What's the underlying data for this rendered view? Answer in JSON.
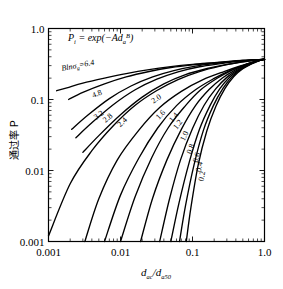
{
  "chart_data": {
    "type": "line",
    "title": "",
    "formula": "P",
    "formula_sub": "i",
    "formula_rest": " = exp(−Ad",
    "formula_sub2": "a",
    "formula_sup2": "B",
    "formula_end": ")",
    "formula_plain": "P_i = exp(-A d_a^B)",
    "xlabel_num": "d",
    "xlabel_num_sub": "ac",
    "xlabel_den": "d",
    "xlabel_den_sub": "a50",
    "xlabel_plain": "d_ac/d_a50",
    "ylabel": "通过率 P",
    "xscale": "log",
    "yscale": "log",
    "xlim": [
      0.001,
      1.0
    ],
    "ylim": [
      0.001,
      1.0
    ],
    "xticklabels": [
      "0.001",
      "0.01",
      "0.1",
      "1.0"
    ],
    "xtickvalues": [
      0.001,
      0.01,
      0.1,
      1.0
    ],
    "yticklabels": [
      "0.001",
      "0.01",
      "0.1",
      "1.0"
    ],
    "ytickvalues": [
      0.001,
      0.01,
      0.1,
      1.0
    ],
    "grid": false,
    "legend_position": "inline-curve-labels",
    "param_name": "Blnσ_g",
    "param_label_prefix": "B",
    "param_label_ln": "ln",
    "param_label_sigma": "σ",
    "param_label_sub": "g",
    "param_label_eq": "=6.4",
    "convergence_point": {
      "x": 1.0,
      "y": 0.368
    },
    "note": "Each curve: P = exp(-0.693 * x^(-B)) family; curves all pass through (1.0, 0.368)",
    "series": [
      {
        "name": "6.4",
        "B": 6.4,
        "label": "Blnσ_g=6.4",
        "x": [
          0.0013,
          0.0018,
          0.003,
          0.006,
          0.012,
          0.025,
          0.05,
          0.1,
          0.2,
          0.35,
          0.55,
          0.75,
          1.0
        ],
        "y": [
          0.133,
          0.146,
          0.17,
          0.2,
          0.232,
          0.264,
          0.29,
          0.312,
          0.33,
          0.346,
          0.356,
          0.363,
          0.368
        ]
      },
      {
        "name": "4.8",
        "B": 4.8,
        "label": "4.8",
        "x": [
          0.0019,
          0.003,
          0.006,
          0.012,
          0.025,
          0.05,
          0.1,
          0.2,
          0.35,
          0.55,
          0.75,
          1.0
        ],
        "y": [
          0.1,
          0.126,
          0.166,
          0.208,
          0.248,
          0.282,
          0.308,
          0.328,
          0.345,
          0.356,
          0.363,
          0.368
        ]
      },
      {
        "name": "3.2",
        "B": 3.2,
        "label": "3.2",
        "x": [
          0.0021,
          0.0035,
          0.007,
          0.014,
          0.028,
          0.055,
          0.11,
          0.22,
          0.38,
          0.58,
          0.78,
          1.0
        ],
        "y": [
          0.038,
          0.06,
          0.103,
          0.155,
          0.208,
          0.255,
          0.295,
          0.324,
          0.344,
          0.357,
          0.364,
          0.368
        ]
      },
      {
        "name": "2.8",
        "B": 2.8,
        "label": "2.8",
        "x": [
          0.0024,
          0.004,
          0.008,
          0.016,
          0.032,
          0.063,
          0.125,
          0.25,
          0.4,
          0.6,
          0.8,
          1.0
        ],
        "y": [
          0.029,
          0.047,
          0.085,
          0.137,
          0.193,
          0.245,
          0.289,
          0.32,
          0.341,
          0.355,
          0.363,
          0.368
        ]
      },
      {
        "name": "2.4",
        "B": 2.4,
        "label": "2.4",
        "x": [
          0.003,
          0.005,
          0.01,
          0.02,
          0.04,
          0.08,
          0.16,
          0.3,
          0.48,
          0.68,
          0.85,
          1.0
        ],
        "y": [
          0.018,
          0.031,
          0.061,
          0.108,
          0.166,
          0.224,
          0.273,
          0.312,
          0.337,
          0.353,
          0.362,
          0.368
        ]
      },
      {
        "name": "2.0",
        "B": 2.0,
        "label": "2.0",
        "x": [
          0.001,
          0.002,
          0.004,
          0.008,
          0.016,
          0.032,
          0.063,
          0.125,
          0.25,
          0.42,
          0.62,
          0.82,
          1.0
        ],
        "y": [
          0.0012,
          0.0065,
          0.019,
          0.043,
          0.083,
          0.134,
          0.191,
          0.247,
          0.297,
          0.33,
          0.35,
          0.362,
          0.368
        ]
      },
      {
        "name": "1.6",
        "B": 1.6,
        "label": "1.6",
        "x": [
          0.0032,
          0.005,
          0.009,
          0.018,
          0.035,
          0.07,
          0.14,
          0.28,
          0.45,
          0.65,
          0.84,
          1.0
        ],
        "y": [
          0.001,
          0.004,
          0.014,
          0.037,
          0.077,
          0.13,
          0.19,
          0.249,
          0.294,
          0.33,
          0.355,
          0.368
        ]
      },
      {
        "name": "1.4",
        "B": 1.4,
        "label": "1.4",
        "x": [
          0.006,
          0.01,
          0.018,
          0.033,
          0.06,
          0.11,
          0.2,
          0.33,
          0.5,
          0.7,
          0.86,
          1.0
        ],
        "y": [
          0.001,
          0.0045,
          0.015,
          0.04,
          0.082,
          0.137,
          0.198,
          0.255,
          0.301,
          0.336,
          0.357,
          0.368
        ]
      },
      {
        "name": "1.2",
        "B": 1.2,
        "label": "1.2",
        "x": [
          0.01,
          0.016,
          0.027,
          0.046,
          0.08,
          0.13,
          0.22,
          0.35,
          0.52,
          0.72,
          0.87,
          1.0
        ],
        "y": [
          0.001,
          0.0043,
          0.015,
          0.04,
          0.082,
          0.137,
          0.199,
          0.257,
          0.303,
          0.339,
          0.358,
          0.368
        ]
      },
      {
        "name": "1.0",
        "B": 1.0,
        "label": "1.0",
        "x": [
          0.019,
          0.028,
          0.044,
          0.07,
          0.11,
          0.17,
          0.26,
          0.39,
          0.56,
          0.74,
          0.88,
          1.0
        ],
        "y": [
          0.001,
          0.0041,
          0.014,
          0.038,
          0.082,
          0.138,
          0.201,
          0.26,
          0.307,
          0.341,
          0.359,
          0.368
        ]
      },
      {
        "name": "0.8",
        "B": 0.8,
        "label": "0.8",
        "x": [
          0.035,
          0.048,
          0.068,
          0.1,
          0.145,
          0.21,
          0.3,
          0.43,
          0.59,
          0.76,
          0.89,
          1.0
        ],
        "y": [
          0.001,
          0.004,
          0.014,
          0.039,
          0.083,
          0.141,
          0.205,
          0.264,
          0.31,
          0.343,
          0.36,
          0.368
        ]
      },
      {
        "name": "0.6",
        "B": 0.6,
        "label": "0.6",
        "x": [
          0.05,
          0.065,
          0.09,
          0.125,
          0.175,
          0.24,
          0.33,
          0.46,
          0.62,
          0.78,
          0.9,
          1.0
        ],
        "y": [
          0.001,
          0.0035,
          0.013,
          0.038,
          0.082,
          0.142,
          0.208,
          0.267,
          0.313,
          0.345,
          0.361,
          0.368
        ]
      },
      {
        "name": "0.4",
        "B": 0.4,
        "label": "0.4",
        "x": [
          0.066,
          0.08,
          0.105,
          0.142,
          0.195,
          0.265,
          0.355,
          0.48,
          0.64,
          0.79,
          0.91,
          1.0
        ],
        "y": [
          0.001,
          0.0032,
          0.012,
          0.037,
          0.082,
          0.143,
          0.21,
          0.269,
          0.315,
          0.346,
          0.362,
          0.368
        ]
      },
      {
        "name": "0.2",
        "B": 0.2,
        "label": "0.2",
        "x": [
          0.082,
          0.095,
          0.12,
          0.158,
          0.212,
          0.283,
          0.375,
          0.5,
          0.66,
          0.81,
          0.92,
          1.0
        ],
        "y": [
          0.001,
          0.003,
          0.012,
          0.036,
          0.081,
          0.143,
          0.211,
          0.271,
          0.317,
          0.347,
          0.362,
          0.368
        ]
      }
    ]
  }
}
